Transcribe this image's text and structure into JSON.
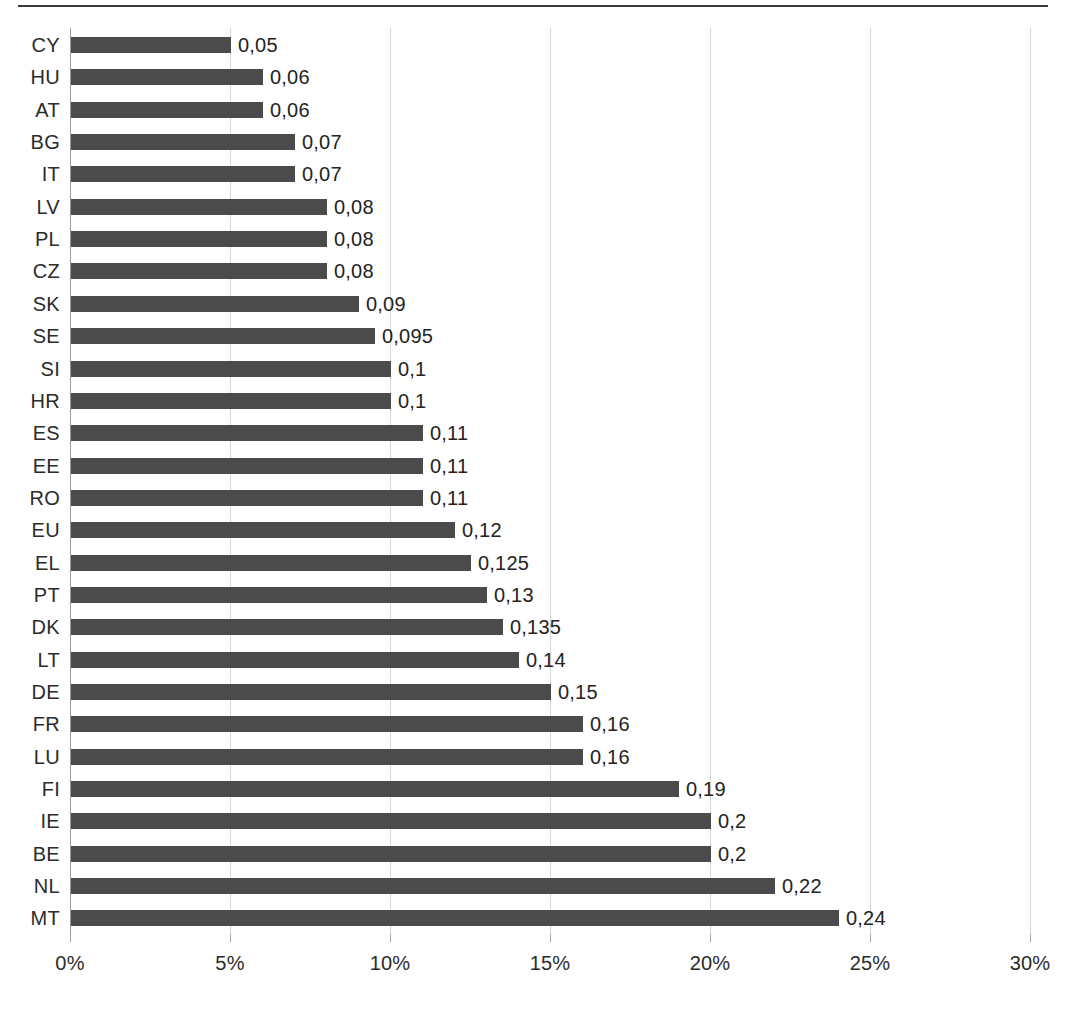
{
  "chart_data": {
    "type": "bar",
    "orientation": "horizontal",
    "title": "",
    "subtitle": "",
    "xlabel": "",
    "ylabel": "",
    "xlim": [
      0,
      0.3
    ],
    "xticks": [
      0,
      0.05,
      0.1,
      0.15,
      0.2,
      0.25,
      0.3
    ],
    "xtick_labels": [
      "0%",
      "5%",
      "10%",
      "15%",
      "20%",
      "25%",
      "30%"
    ],
    "grid": true,
    "legend": false,
    "bar_color": "#4b4b4b",
    "categories": [
      "CY",
      "HU",
      "AT",
      "BG",
      "IT",
      "LV",
      "PL",
      "CZ",
      "SK",
      "SE",
      "SI",
      "HR",
      "ES",
      "EE",
      "RO",
      "EU",
      "EL",
      "PT",
      "DK",
      "LT",
      "DE",
      "FR",
      "LU",
      "FI",
      "IE",
      "BE",
      "NL",
      "MT"
    ],
    "values": [
      0.05,
      0.06,
      0.06,
      0.07,
      0.07,
      0.08,
      0.08,
      0.08,
      0.09,
      0.095,
      0.1,
      0.1,
      0.11,
      0.11,
      0.11,
      0.12,
      0.125,
      0.13,
      0.135,
      0.14,
      0.15,
      0.16,
      0.16,
      0.19,
      0.2,
      0.2,
      0.22,
      0.24
    ],
    "value_labels": [
      "0,05",
      "0,06",
      "0,06",
      "0,07",
      "0,07",
      "0,08",
      "0,08",
      "0,08",
      "0,09",
      "0,095",
      "0,1",
      "0,1",
      "0,11",
      "0,11",
      "0,11",
      "0,12",
      "0,125",
      "0,13",
      "0,135",
      "0,14",
      "0,15",
      "0,16",
      "0,16",
      "0,19",
      "0,2",
      "0,2",
      "0,22",
      "0,24"
    ],
    "rows": [
      {
        "category": "CY",
        "value": 0.05,
        "label": "0,05"
      },
      {
        "category": "HU",
        "value": 0.06,
        "label": "0,06"
      },
      {
        "category": "AT",
        "value": 0.06,
        "label": "0,06"
      },
      {
        "category": "BG",
        "value": 0.07,
        "label": "0,07"
      },
      {
        "category": "IT",
        "value": 0.07,
        "label": "0,07"
      },
      {
        "category": "LV",
        "value": 0.08,
        "label": "0,08"
      },
      {
        "category": "PL",
        "value": 0.08,
        "label": "0,08"
      },
      {
        "category": "CZ",
        "value": 0.08,
        "label": "0,08"
      },
      {
        "category": "SK",
        "value": 0.09,
        "label": "0,09"
      },
      {
        "category": "SE",
        "value": 0.095,
        "label": "0,095"
      },
      {
        "category": "SI",
        "value": 0.1,
        "label": "0,1"
      },
      {
        "category": "HR",
        "value": 0.1,
        "label": "0,1"
      },
      {
        "category": "ES",
        "value": 0.11,
        "label": "0,11"
      },
      {
        "category": "EE",
        "value": 0.11,
        "label": "0,11"
      },
      {
        "category": "RO",
        "value": 0.11,
        "label": "0,11"
      },
      {
        "category": "EU",
        "value": 0.12,
        "label": "0,12"
      },
      {
        "category": "EL",
        "value": 0.125,
        "label": "0,125"
      },
      {
        "category": "PT",
        "value": 0.13,
        "label": "0,13"
      },
      {
        "category": "DK",
        "value": 0.135,
        "label": "0,135"
      },
      {
        "category": "LT",
        "value": 0.14,
        "label": "0,14"
      },
      {
        "category": "DE",
        "value": 0.15,
        "label": "0,15"
      },
      {
        "category": "FR",
        "value": 0.16,
        "label": "0,16"
      },
      {
        "category": "LU",
        "value": 0.16,
        "label": "0,16"
      },
      {
        "category": "FI",
        "value": 0.19,
        "label": "0,19"
      },
      {
        "category": "IE",
        "value": 0.2,
        "label": "0,2"
      },
      {
        "category": "BE",
        "value": 0.2,
        "label": "0,2"
      },
      {
        "category": "NL",
        "value": 0.22,
        "label": "0,22"
      },
      {
        "category": "MT",
        "value": 0.24,
        "label": "0,24"
      }
    ]
  },
  "geometry": {
    "x_origin_px": 70,
    "px_per_unit": 3200,
    "plot_top_px": 28,
    "row_pitch_px": 32.35,
    "bar_height_px": 16
  }
}
